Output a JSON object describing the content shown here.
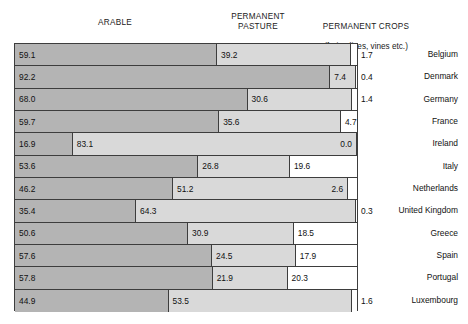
{
  "headers": {
    "arable": "ARABLE",
    "pasture": "PERMANENT\nPASTURE",
    "crops_line1": "PERMANENT CROPS",
    "crops_line2": "(fruit, olives, vines etc.)"
  },
  "colors": {
    "arable": "#b4b4b4",
    "pasture": "#d9d9d9",
    "crops": "#ffffff",
    "outline": "#3d3d3d",
    "text": "#111111"
  },
  "chart_data": {
    "type": "bar",
    "orientation": "horizontal",
    "stacked": true,
    "normalized_percent": true,
    "title": "",
    "xlabel": "",
    "ylabel": "",
    "xlim": [
      0,
      100
    ],
    "grid": false,
    "legend_position": "top",
    "categories": [
      "Belgium",
      "Denmark",
      "Germany",
      "France",
      "Ireland",
      "Italy",
      "Netherlands",
      "United Kingdom",
      "Greece",
      "Spain",
      "Portugal",
      "Luxembourg"
    ],
    "series": [
      {
        "name": "ARABLE",
        "color": "#b4b4b4",
        "values": [
          59.1,
          92.2,
          68.0,
          59.7,
          16.9,
          53.6,
          46.2,
          35.4,
          50.6,
          57.6,
          57.8,
          44.9
        ]
      },
      {
        "name": "PERMANENT PASTURE",
        "color": "#d9d9d9",
        "values": [
          39.2,
          7.4,
          30.6,
          35.6,
          83.1,
          26.8,
          51.2,
          64.3,
          30.9,
          24.5,
          21.9,
          53.5
        ]
      },
      {
        "name": "PERMANENT CROPS (fruit, olives, vines etc.)",
        "color": "#ffffff",
        "values": [
          1.7,
          0.4,
          1.4,
          4.7,
          0.0,
          19.6,
          2.6,
          0.3,
          18.5,
          17.9,
          20.3,
          1.6
        ]
      }
    ]
  },
  "rows": [
    {
      "country": "Belgium",
      "segments": [
        {
          "value": "59.1",
          "pct": 59.1,
          "label_pos": "inside-left"
        },
        {
          "value": "39.2",
          "pct": 39.2,
          "label_pos": "inside-left"
        },
        {
          "value": "1.7",
          "pct": 1.7,
          "label_pos": "outside"
        }
      ]
    },
    {
      "country": "Denmark",
      "segments": [
        {
          "value": "92.2",
          "pct": 92.2,
          "label_pos": "inside-left"
        },
        {
          "value": "7.4",
          "pct": 7.4,
          "label_pos": "inside-left"
        },
        {
          "value": "0.4",
          "pct": 0.4,
          "label_pos": "outside"
        }
      ]
    },
    {
      "country": "Germany",
      "segments": [
        {
          "value": "68.0",
          "pct": 68.0,
          "label_pos": "inside-left"
        },
        {
          "value": "30.6",
          "pct": 30.6,
          "label_pos": "inside-left"
        },
        {
          "value": "1.4",
          "pct": 1.4,
          "label_pos": "outside"
        }
      ]
    },
    {
      "country": "France",
      "segments": [
        {
          "value": "59.7",
          "pct": 59.7,
          "label_pos": "inside-left"
        },
        {
          "value": "35.6",
          "pct": 35.6,
          "label_pos": "inside-left"
        },
        {
          "value": "4.7",
          "pct": 4.7,
          "label_pos": "inside-left"
        }
      ]
    },
    {
      "country": "Ireland",
      "segments": [
        {
          "value": "16.9",
          "pct": 16.9,
          "label_pos": "inside-left"
        },
        {
          "value": "83.1",
          "pct": 83.1,
          "label_pos": "inside-left"
        },
        {
          "value": "0.0",
          "pct": 0.0,
          "label_pos": "pasture-right"
        }
      ]
    },
    {
      "country": "Italy",
      "segments": [
        {
          "value": "53.6",
          "pct": 53.6,
          "label_pos": "inside-left"
        },
        {
          "value": "26.8",
          "pct": 26.8,
          "label_pos": "inside-left"
        },
        {
          "value": "19.6",
          "pct": 19.6,
          "label_pos": "inside-left"
        }
      ]
    },
    {
      "country": "Netherlands",
      "segments": [
        {
          "value": "46.2",
          "pct": 46.2,
          "label_pos": "inside-left"
        },
        {
          "value": "51.2",
          "pct": 51.2,
          "label_pos": "inside-left"
        },
        {
          "value": "2.6",
          "pct": 2.6,
          "label_pos": "pasture-right"
        }
      ]
    },
    {
      "country": "United Kingdom",
      "segments": [
        {
          "value": "35.4",
          "pct": 35.4,
          "label_pos": "inside-left"
        },
        {
          "value": "64.3",
          "pct": 64.3,
          "label_pos": "inside-left"
        },
        {
          "value": "0.3",
          "pct": 0.3,
          "label_pos": "outside"
        }
      ]
    },
    {
      "country": "Greece",
      "segments": [
        {
          "value": "50.6",
          "pct": 50.6,
          "label_pos": "inside-left"
        },
        {
          "value": "30.9",
          "pct": 30.9,
          "label_pos": "inside-left"
        },
        {
          "value": "18.5",
          "pct": 18.5,
          "label_pos": "inside-left"
        }
      ]
    },
    {
      "country": "Spain",
      "segments": [
        {
          "value": "57.6",
          "pct": 57.6,
          "label_pos": "inside-left"
        },
        {
          "value": "24.5",
          "pct": 24.5,
          "label_pos": "inside-left"
        },
        {
          "value": "17.9",
          "pct": 17.9,
          "label_pos": "inside-left"
        }
      ]
    },
    {
      "country": "Portugal",
      "segments": [
        {
          "value": "57.8",
          "pct": 57.8,
          "label_pos": "inside-left"
        },
        {
          "value": "21.9",
          "pct": 21.9,
          "label_pos": "inside-left"
        },
        {
          "value": "20.3",
          "pct": 20.3,
          "label_pos": "inside-left"
        }
      ]
    },
    {
      "country": "Luxembourg",
      "segments": [
        {
          "value": "44.9",
          "pct": 44.9,
          "label_pos": "inside-left"
        },
        {
          "value": "53.5",
          "pct": 53.5,
          "label_pos": "inside-left"
        },
        {
          "value": "1.6",
          "pct": 1.6,
          "label_pos": "outside"
        }
      ]
    }
  ]
}
